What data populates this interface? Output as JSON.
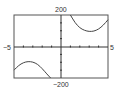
{
  "chart_data": {
    "type": "line",
    "title": "",
    "xlabel": "",
    "ylabel": "",
    "xlim": [
      -5,
      5
    ],
    "ylim": [
      -200,
      200
    ],
    "x_tick_step": 1,
    "y_tick_step": 50,
    "grid": false,
    "legend": null,
    "axis_labels": {
      "xmin": "−5",
      "xmax": "5",
      "ymax": "200",
      "ymin": "−200"
    },
    "series": [
      {
        "name": "right-branch",
        "points": [
          [
            1.0,
            200
          ],
          [
            1.5,
            150
          ],
          [
            2.0,
            118
          ],
          [
            2.5,
            102
          ],
          [
            3.0,
            95
          ],
          [
            3.5,
            97
          ],
          [
            4.0,
            110
          ],
          [
            4.5,
            135
          ],
          [
            5.0,
            170
          ]
        ]
      },
      {
        "name": "left-branch",
        "points": [
          [
            -5.0,
            -150
          ],
          [
            -4.5,
            -120
          ],
          [
            -4.0,
            -102
          ],
          [
            -3.5,
            -95
          ],
          [
            -3.0,
            -98
          ],
          [
            -2.5,
            -112
          ],
          [
            -2.0,
            -140
          ],
          [
            -1.5,
            -175
          ],
          [
            -1.1,
            -200
          ]
        ]
      }
    ],
    "colors": {
      "frame": "#444444",
      "axis": "#333333",
      "curve": "#444444"
    }
  }
}
